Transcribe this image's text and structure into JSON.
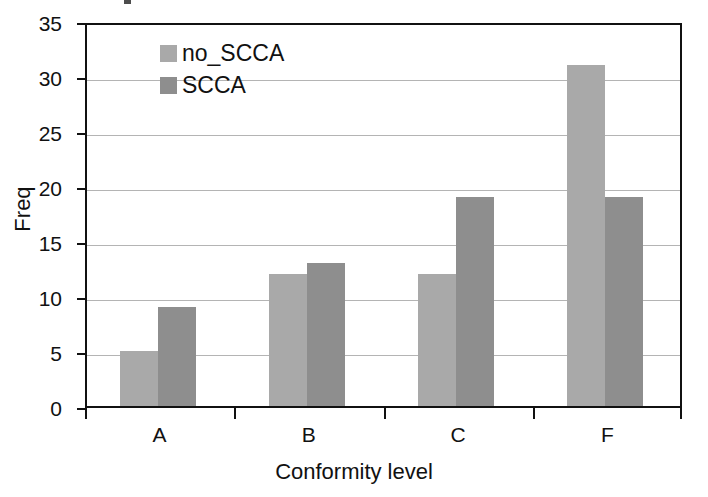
{
  "chart_data": {
    "type": "bar",
    "title": "",
    "xlabel": "Conformity level",
    "ylabel": "Freq",
    "categories": [
      "A",
      "B",
      "C",
      "F"
    ],
    "series": [
      {
        "name": "no_SCCA",
        "color": "#a9a9a9",
        "values": [
          5,
          12,
          12,
          31
        ]
      },
      {
        "name": "SCCA",
        "color": "#8e8e8e",
        "values": [
          9,
          13,
          19,
          19
        ]
      }
    ],
    "ylim": [
      0,
      35
    ],
    "yticks": [
      0,
      5,
      10,
      15,
      20,
      25,
      30,
      35
    ],
    "ytick_labels": [
      "0",
      "5",
      "10",
      "15",
      "20",
      "25",
      "30",
      "35"
    ],
    "grid": "horizontal",
    "legend_position": "top-left-inside",
    "axis_color": "#111111",
    "gridline_color": "#b4b4b4",
    "background": "#ffffff"
  }
}
